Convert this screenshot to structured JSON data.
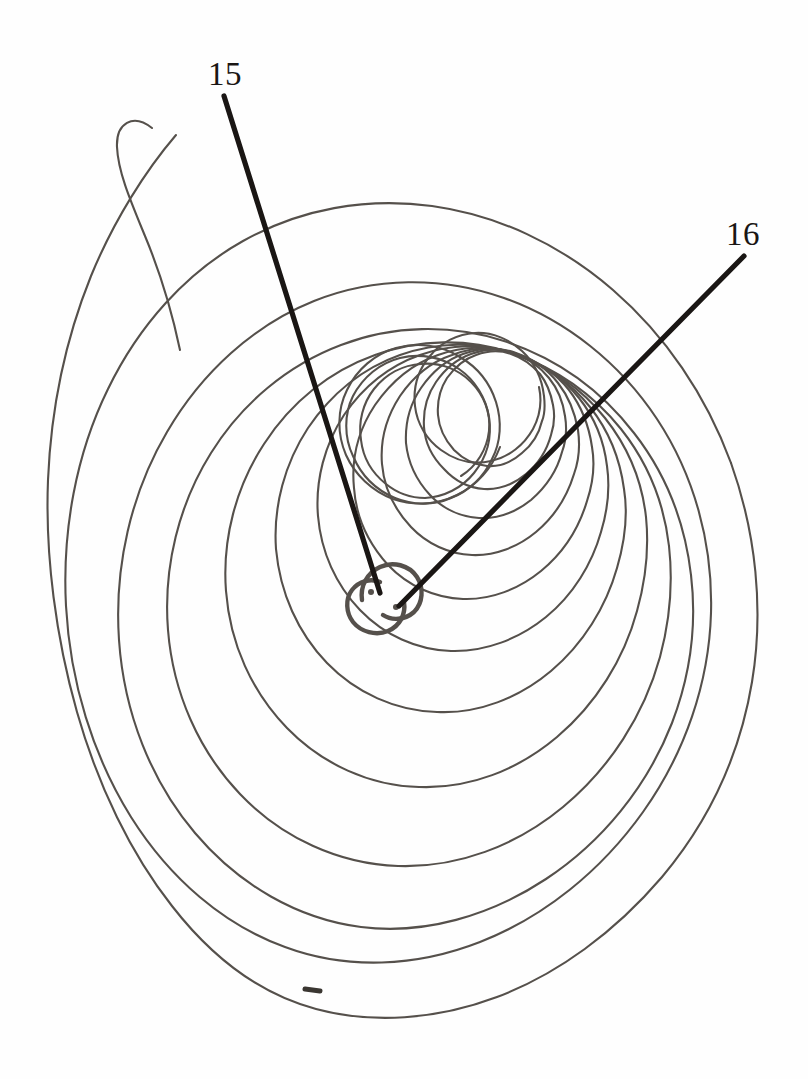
{
  "figure": {
    "kind": "line-drawing",
    "background_color": "#fefefe",
    "spiral_stroke_color": "#55504b",
    "spiral_stroke_width": 2.1,
    "leader_stroke_color": "#1a1614",
    "leader_stroke_width": 5.2,
    "canvas": {
      "width": 808,
      "height": 1079
    }
  },
  "callouts": [
    {
      "id": "15",
      "label": "15",
      "label_x": 208,
      "label_y": 58,
      "leader_start_x": 224,
      "leader_start_y": 96,
      "leader_end_x": 380,
      "leader_end_y": 593
    },
    {
      "id": "16",
      "label": "16",
      "label_x": 726,
      "label_y": 218,
      "leader_start_x": 744,
      "leader_start_y": 256,
      "leader_end_x": 399,
      "leader_end_y": 606
    }
  ],
  "spiral": {
    "center_x": 382,
    "center_y": 598,
    "turns": 14,
    "bounds": {
      "left": 48,
      "top": 190,
      "right": 756,
      "bottom": 1012
    },
    "tail_hook": {
      "present": true,
      "x": 130,
      "y": 120
    },
    "center_motif": "double-curl S",
    "blemish_mark": {
      "x": 312,
      "y": 990
    }
  }
}
